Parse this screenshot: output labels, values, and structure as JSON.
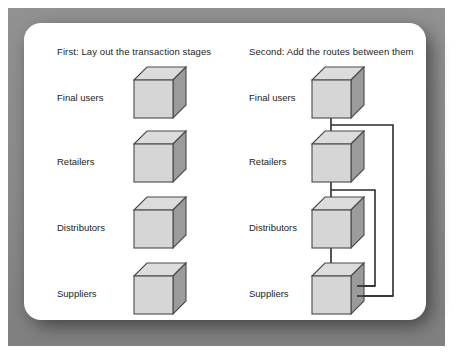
{
  "figure": {
    "panels": [
      {
        "id": "left",
        "heading": "First: Lay out the transaction stages",
        "stages": [
          {
            "label": "Final users",
            "icon": "cube-icon"
          },
          {
            "label": "Retailers",
            "icon": "cube-icon"
          },
          {
            "label": "Distributors",
            "icon": "cube-icon"
          },
          {
            "label": "Suppliers",
            "icon": "cube-icon"
          }
        ]
      },
      {
        "id": "right",
        "heading": "Second: Add the routes between them",
        "stages": [
          {
            "label": "Final users",
            "icon": "cube-icon"
          },
          {
            "label": "Retailers",
            "icon": "cube-icon"
          },
          {
            "label": "Distributors",
            "icon": "cube-icon"
          },
          {
            "label": "Suppliers",
            "icon": "cube-icon"
          }
        ],
        "routes": [
          {
            "from": "Final users",
            "to": "Retailers",
            "style": "direct"
          },
          {
            "from": "Retailers",
            "to": "Distributors",
            "style": "direct"
          },
          {
            "from": "Distributors",
            "to": "Suppliers",
            "style": "direct"
          },
          {
            "from": "Final users",
            "to": "Suppliers",
            "style": "bypass-outer"
          },
          {
            "from": "Retailers",
            "to": "Suppliers",
            "style": "bypass-inner"
          }
        ]
      }
    ]
  },
  "colors": {
    "frame": "#8d8d8d",
    "card": "#ffffff",
    "cube_front": "#d6d6d6",
    "cube_top": "#dcdcdc",
    "cube_side": "#9b9b9b",
    "cube_outline": "#4a4a4a",
    "route_line": "#2b2b2b",
    "text": "#1d1d1d"
  }
}
